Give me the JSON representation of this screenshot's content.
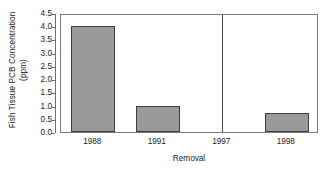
{
  "chart_data": {
    "type": "bar",
    "title": "",
    "categories": [
      "1988",
      "1991",
      "1997",
      "1998"
    ],
    "values": [
      4.0,
      1.0,
      0.0,
      0.72
    ],
    "xlabel": "Removal",
    "ylabel": "Fish Tissue PCB Concentration (ppm)",
    "ylabel_line1": "Fish Tissue PCB Concentration",
    "ylabel_line2": "(ppm)",
    "ylim": [
      0.0,
      4.5
    ],
    "ytick_labels": [
      "0.0",
      "0.5",
      "1.0",
      "1.5",
      "2.0",
      "2.5",
      "3.0",
      "3.5",
      "4.0",
      "4.5"
    ],
    "ytick_values": [
      0.0,
      0.5,
      1.0,
      1.5,
      2.0,
      2.5,
      3.0,
      3.5,
      4.0,
      4.5
    ],
    "grid": false,
    "legend": "none",
    "bar_fill_color": "#9a9a9a",
    "bar_edge_color": "#3d3d3d",
    "frame_color": "#7a7a7a",
    "axis_color": "#6e6e6e",
    "background_color": "#ffffff",
    "annotations": [
      {
        "name": "removal-divider",
        "type": "vertical-line",
        "between_categories": [
          "1997",
          "1998"
        ],
        "position_category_index": 2,
        "color": "#4a4a4a"
      }
    ]
  }
}
